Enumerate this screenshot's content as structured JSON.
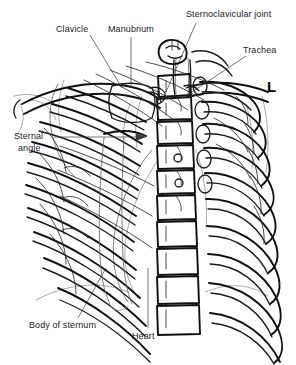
{
  "figure": {
    "width": 296,
    "height": 365,
    "background_color": "#ffffff",
    "line_color": "#101010",
    "soft_tissue_color": "#8d8d8d",
    "label_color": "#1a1a1a"
  },
  "side_marker": {
    "label": "L",
    "meaning": "left side marker"
  },
  "labels": [
    {
      "id": "clavicle",
      "text": "Clavicle",
      "x": 56,
      "y": 28
    },
    {
      "id": "manubrium",
      "text": "Manubrium",
      "x": 108,
      "y": 28
    },
    {
      "id": "sternoclavicular_joint",
      "text": "Sternoclavicular joint",
      "x": 186,
      "y": 12
    },
    {
      "id": "trachea",
      "text": "Trachea",
      "x": 243,
      "y": 49
    },
    {
      "id": "sternal_angle",
      "text_line1": "Sternal",
      "text_line2": "angle",
      "x": 14,
      "y": 131
    },
    {
      "id": "body_of_sternum",
      "text": "Body of sternum",
      "x": 29,
      "y": 320
    },
    {
      "id": "heart",
      "text": "Heart",
      "x": 132,
      "y": 331
    }
  ],
  "anatomy": {
    "structures": [
      "vertebral bodies",
      "ribs",
      "clavicles",
      "manubrium",
      "sternal angle",
      "body of sternum",
      "sternoclavicular joints",
      "trachea",
      "heart border",
      "scapula",
      "diaphragm"
    ],
    "vertebra_count": 10,
    "rib_pairs": 10
  }
}
